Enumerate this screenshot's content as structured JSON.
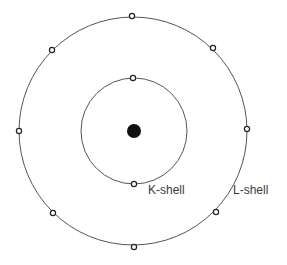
{
  "diagram": {
    "canvas": {
      "width": 287,
      "height": 265,
      "background": "#ffffff"
    },
    "colors": {
      "stroke": "#555555",
      "nucleus": "#111111",
      "electron_fill": "#ffffff",
      "label": "#3a3a3a"
    },
    "nucleus": {
      "cx": 134,
      "cy": 131,
      "r": 7
    },
    "shells": [
      {
        "name": "K-shell",
        "label": "K-shell",
        "cx": 134,
        "cy": 131,
        "r": 53,
        "label_pos": {
          "x": 148,
          "y": 184
        },
        "electrons": [
          {
            "x": 133,
            "y": 78
          },
          {
            "x": 134,
            "y": 184
          }
        ]
      },
      {
        "name": "L-shell",
        "label": "L-shell",
        "cx": 133,
        "cy": 131,
        "r": 114,
        "label_pos": {
          "x": 233,
          "y": 184
        },
        "electrons": [
          {
            "x": 132,
            "y": 16
          },
          {
            "x": 213,
            "y": 48
          },
          {
            "x": 247,
            "y": 129
          },
          {
            "x": 216,
            "y": 212
          },
          {
            "x": 134,
            "y": 247
          },
          {
            "x": 53,
            "y": 213
          },
          {
            "x": 19,
            "y": 131
          },
          {
            "x": 52,
            "y": 50
          }
        ]
      }
    ]
  }
}
